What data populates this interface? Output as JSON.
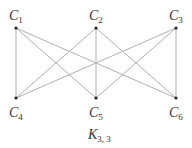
{
  "graph": {
    "caption": {
      "main": "K",
      "sub": "3, 3"
    },
    "nodes": [
      {
        "id": "C1",
        "letter": "C",
        "sub": "1",
        "row": "top",
        "col": 0
      },
      {
        "id": "C2",
        "letter": "C",
        "sub": "2",
        "row": "top",
        "col": 1
      },
      {
        "id": "C3",
        "letter": "C",
        "sub": "3",
        "row": "top",
        "col": 2
      },
      {
        "id": "C4",
        "letter": "C",
        "sub": "4",
        "row": "bottom",
        "col": 0
      },
      {
        "id": "C5",
        "letter": "C",
        "sub": "5",
        "row": "bottom",
        "col": 1
      },
      {
        "id": "C6",
        "letter": "C",
        "sub": "6",
        "row": "bottom",
        "col": 2
      }
    ],
    "edges": [
      [
        "C1",
        "C4"
      ],
      [
        "C1",
        "C5"
      ],
      [
        "C1",
        "C6"
      ],
      [
        "C2",
        "C4"
      ],
      [
        "C2",
        "C5"
      ],
      [
        "C2",
        "C6"
      ],
      [
        "C3",
        "C4"
      ],
      [
        "C3",
        "C5"
      ],
      [
        "C3",
        "C6"
      ]
    ]
  }
}
